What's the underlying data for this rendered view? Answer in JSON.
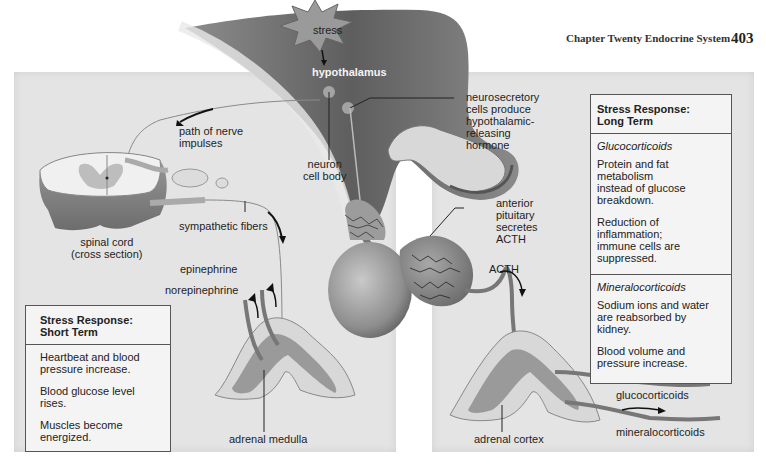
{
  "page": {
    "header": "Chapter Twenty  Endocrine System",
    "page_number": "403"
  },
  "diagram": {
    "title_triggers": {
      "stress": "stress",
      "hypothalamus": "hypothalamus"
    },
    "labels": {
      "neurosecretory": "neurosecretory\ncells produce\nhypothalamic-\nreleasing\nhormone",
      "neuron_cell_body": "neuron\ncell body",
      "path_of_nerve_impulses": "path of nerve\nimpulses",
      "spinal_cord": "spinal cord\n(cross section)",
      "sympathetic_fibers": "sympathetic fibers",
      "anterior_pituitary": "anterior\npituitary\nsecretes\nACTH",
      "acth": "ACTH",
      "epinephrine": "epinephrine",
      "norepinephrine": "norepinephrine",
      "adrenal_medulla": "adrenal medulla",
      "adrenal_cortex": "adrenal cortex",
      "glucocorticoids": "glucocorticoids",
      "mineralocorticoids": "mineralocorticoids"
    }
  },
  "short_term_box": {
    "title": "Stress Response:\nShort Term",
    "items": [
      "Heartbeat and blood\npressure increase.",
      "Blood glucose level rises.",
      "Muscles become\nenergized."
    ]
  },
  "long_term_box": {
    "title": "Stress Response:\nLong Term",
    "sections": [
      {
        "heading": "Glucocorticoids",
        "items": [
          "Protein and fat metabolism\ninstead of glucose\nbreakdown.",
          "Reduction of inflammation;\nimmune cells are\nsuppressed."
        ]
      },
      {
        "heading": "Mineralocorticoids",
        "items": [
          "Sodium ions and water\nare reabsorbed by kidney.",
          "Blood volume and\npressure increase."
        ]
      }
    ]
  }
}
